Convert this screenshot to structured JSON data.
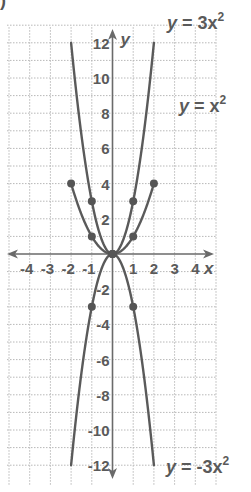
{
  "corner_label": ")",
  "chart_data": {
    "type": "line",
    "title": "",
    "xlabel": "x",
    "ylabel": "y",
    "xlim": [
      -5,
      5
    ],
    "ylim": [
      -13,
      13
    ],
    "grid": true,
    "x_ticks": [
      -4,
      -3,
      -2,
      -1,
      1,
      2,
      3,
      4
    ],
    "y_ticks": [
      -12,
      -10,
      -8,
      -6,
      -4,
      -2,
      2,
      4,
      6,
      8,
      10,
      12
    ],
    "series": [
      {
        "name": "y = 3x^2",
        "function": "3*x^2",
        "domain": [
          -2,
          2
        ],
        "points": [
          {
            "x": -1,
            "y": 3
          },
          {
            "x": 0,
            "y": 0
          },
          {
            "x": 1,
            "y": 3
          }
        ]
      },
      {
        "name": "y = x^2",
        "function": "x^2",
        "domain": [
          -2,
          2
        ],
        "points": [
          {
            "x": -2,
            "y": 4
          },
          {
            "x": -1,
            "y": 1
          },
          {
            "x": 0,
            "y": 0
          },
          {
            "x": 1,
            "y": 1
          },
          {
            "x": 2,
            "y": 4
          }
        ]
      },
      {
        "name": "y = -3x^2",
        "function": "-3*x^2",
        "domain": [
          -2,
          2
        ],
        "points": [
          {
            "x": -1,
            "y": -3
          },
          {
            "x": 0,
            "y": 0
          },
          {
            "x": 1,
            "y": -3
          }
        ]
      }
    ],
    "annotations": [
      {
        "text_var": "y",
        "text_eq": "= 3x",
        "sup": "2",
        "near": "top-right"
      },
      {
        "text_var": "y",
        "text_eq": "= x",
        "sup": "2",
        "near": "upper-right"
      },
      {
        "text_var": "y",
        "text_eq": "= -3x",
        "sup": "2",
        "near": "bottom-right"
      }
    ]
  }
}
